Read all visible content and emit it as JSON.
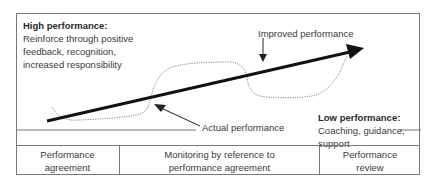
{
  "high_performance": {
    "title": "High performance:",
    "lines": [
      "Reinforce through positive",
      "feedback, recognition,",
      "increased responsibility"
    ]
  },
  "low_performance": {
    "title": "Low performance:",
    "lines": [
      "Coaching, guidance,",
      "support"
    ]
  },
  "labels": {
    "improved": "Improved performance",
    "actual": "Actual performance"
  },
  "stages": [
    {
      "lines": [
        "Performance",
        "agreement"
      ]
    },
    {
      "lines": [
        "Monitoring by reference to",
        "performance agreement"
      ]
    },
    {
      "lines": [
        "Performance",
        "review"
      ]
    }
  ],
  "colors": {
    "border": "#777777",
    "main_arrow": "#111111",
    "dotted_curve": "#888888",
    "text": "#3a3a3a"
  }
}
